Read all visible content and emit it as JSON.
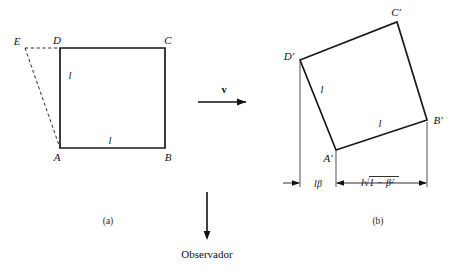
{
  "figure": {
    "background_color": "#ffffff",
    "line_color": "#1a1a1a",
    "panel_a": {
      "caption": "(a)",
      "vertices": {
        "A": "A",
        "B": "B",
        "C": "C",
        "D": "D",
        "E": "E"
      },
      "side_label_vertical": "l",
      "side_label_horizontal": "l"
    },
    "panel_b": {
      "caption": "(b)",
      "vertices": {
        "A_prime": "A′",
        "B_prime": "B′",
        "C_prime": "C′",
        "D_prime": "D′"
      },
      "side_label_left": "l",
      "side_label_bottom": "l",
      "dimension_left": "lβ",
      "dimension_right_prefix": "l",
      "dimension_right_radical": "√",
      "dimension_right_radicand": "1 − β",
      "dimension_right_exponent": "2"
    },
    "velocity_arrow_label": "v",
    "observer_label": "Observador"
  }
}
